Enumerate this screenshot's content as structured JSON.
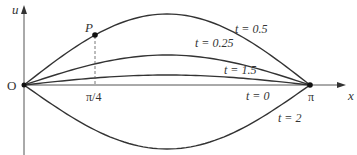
{
  "diagram": {
    "type": "standing-wave-profiles",
    "axes": {
      "x_label": "x",
      "y_label": "u",
      "origin_label": "O",
      "x_ticks": [
        {
          "label": "π/4",
          "value": 0.7854
        },
        {
          "label": "π",
          "value": 3.1416
        }
      ]
    },
    "point": {
      "label": "P",
      "x": "π/4"
    },
    "curves": [
      {
        "label": "t = 0.5",
        "amplitude": 71
      },
      {
        "label": "t = 0.25",
        "amplitude": 30
      },
      {
        "label": "t = 1.5",
        "amplitude": 10
      },
      {
        "label": "t = 0",
        "amplitude": 0
      },
      {
        "label": "t = 2",
        "amplitude": -64
      }
    ]
  }
}
